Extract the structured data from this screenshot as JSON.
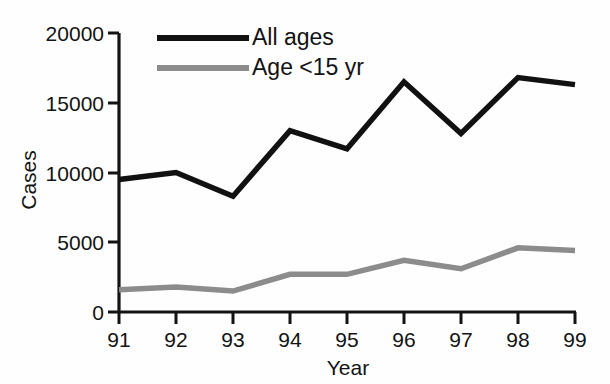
{
  "chart_data": {
    "type": "line",
    "title": "",
    "xlabel": "Year",
    "ylabel": "Cases",
    "categories": [
      "91",
      "92",
      "93",
      "94",
      "95",
      "96",
      "97",
      "98",
      "99"
    ],
    "x": [
      91,
      92,
      93,
      94,
      95,
      96,
      97,
      98,
      99
    ],
    "xlim": [
      91,
      99
    ],
    "ylim": [
      0,
      20000
    ],
    "yticks": [
      0,
      5000,
      10000,
      15000,
      20000
    ],
    "ytick_labels": [
      "0",
      "5000",
      "10000",
      "15000",
      "20000"
    ],
    "xtick_labels": [
      "91",
      "92",
      "93",
      "94",
      "95",
      "96",
      "97",
      "98",
      "99"
    ],
    "grid": false,
    "legend_position": "top-left-inside",
    "series": [
      {
        "name": "All ages",
        "color": "#111111",
        "values": [
          9500,
          10000,
          8300,
          13000,
          11700,
          16500,
          12800,
          16800,
          16300
        ]
      },
      {
        "name": "Age <15 yr",
        "color": "#8c8c8c",
        "values": [
          1600,
          1800,
          1500,
          2700,
          2700,
          3700,
          3100,
          4600,
          4400
        ]
      }
    ]
  },
  "axes": {
    "y_title": "Cases",
    "x_title": "Year"
  },
  "legend": {
    "entries": [
      {
        "label": "All ages",
        "color": "#111111"
      },
      {
        "label": "Age <15 yr",
        "color": "#8c8c8c"
      }
    ]
  }
}
